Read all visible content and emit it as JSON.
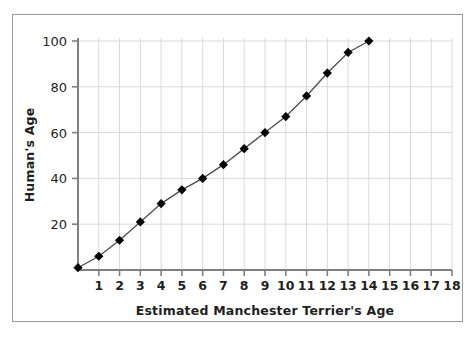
{
  "chart_data": {
    "type": "line",
    "title": "",
    "xlabel": "Estimated Manchester Terrier's Age",
    "ylabel": "Human's Age",
    "x": [
      0,
      1,
      2,
      3,
      4,
      5,
      6,
      7,
      8,
      9,
      10,
      11,
      12,
      13,
      14
    ],
    "values": [
      1,
      6,
      13,
      21,
      29,
      35,
      40,
      46,
      53,
      60,
      67,
      76,
      86,
      95,
      100
    ],
    "series": [
      {
        "name": "Manchester Terrier age to human age",
        "values": [
          1,
          6,
          13,
          21,
          29,
          35,
          40,
          46,
          53,
          60,
          67,
          76,
          86,
          95,
          100
        ]
      }
    ],
    "xlim": [
      0,
      18
    ],
    "ylim": [
      0,
      105
    ],
    "xticks": [
      1,
      2,
      3,
      4,
      5,
      6,
      7,
      8,
      9,
      10,
      11,
      12,
      13,
      14,
      15,
      16,
      17,
      18
    ],
    "yticks": [
      20,
      40,
      60,
      80,
      100
    ],
    "xtick_labels": [
      "1",
      "2",
      "3",
      "4",
      "5",
      "6",
      "7",
      "8",
      "9",
      "10",
      "11",
      "12",
      "13",
      "14",
      "15",
      "16",
      "17",
      "18"
    ],
    "ytick_labels": [
      "20",
      "40",
      "60",
      "80",
      "100"
    ],
    "grid": true,
    "grid_color": "#d9d9d9",
    "legend": null,
    "marker": "diamond",
    "marker_color": "#000000",
    "line_color": "#4d4d4d",
    "axis_color": "#808080",
    "border_color": "#9a9a9a",
    "background": "#ffffff"
  }
}
